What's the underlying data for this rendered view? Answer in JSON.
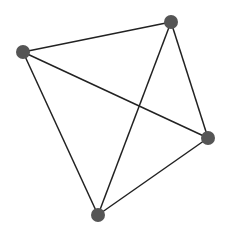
{
  "canvas": {
    "width": 228,
    "height": 231,
    "background": "#ffffff"
  },
  "style": {
    "node_color": "#555555",
    "node_radius": 7,
    "edge_color": "#222222",
    "edge_width": 1.5
  },
  "nodes": [
    {
      "id": "A",
      "x": 23,
      "y": 52
    },
    {
      "id": "B",
      "x": 171,
      "y": 22
    },
    {
      "id": "C",
      "x": 208,
      "y": 138
    },
    {
      "id": "D",
      "x": 98,
      "y": 215
    }
  ],
  "edges": [
    {
      "source": "A",
      "target": "B"
    },
    {
      "source": "A",
      "target": "C"
    },
    {
      "source": "A",
      "target": "D"
    },
    {
      "source": "B",
      "target": "C"
    },
    {
      "source": "B",
      "target": "D"
    },
    {
      "source": "C",
      "target": "D"
    }
  ]
}
